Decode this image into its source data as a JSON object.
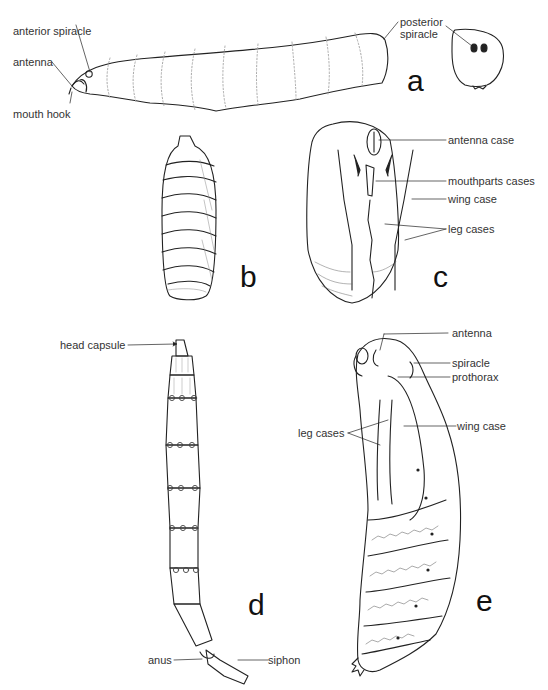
{
  "figure": {
    "panels": [
      {
        "id": "a",
        "letter": "a",
        "subject": "fly larva (maggot), lateral view, with posterior end view",
        "labels": [
          "anterior spiracle",
          "antenna",
          "mouth hook",
          "posterior spiracle"
        ]
      },
      {
        "id": "b",
        "letter": "b",
        "subject": "fly puparium",
        "labels": []
      },
      {
        "id": "c",
        "letter": "c",
        "subject": "pupa, ventral view",
        "labels": [
          "antenna case",
          "mouthparts cases",
          "wing case",
          "leg cases"
        ]
      },
      {
        "id": "d",
        "letter": "d",
        "subject": "aquatic larva with siphon",
        "labels": [
          "head capsule",
          "anus",
          "siphon"
        ]
      },
      {
        "id": "e",
        "letter": "e",
        "subject": "pupa, lateral view",
        "labels": [
          "antenna",
          "spiracle",
          "prothorax",
          "leg cases",
          "wing case"
        ]
      }
    ]
  },
  "labels": {
    "a": {
      "anterior_spiracle": "anterior spiracle",
      "antenna": "antenna",
      "mouth_hook": "mouth hook",
      "posterior_spiracle_1": "posterior",
      "posterior_spiracle_2": "spiracle"
    },
    "c": {
      "antenna_case": "antenna case",
      "mouthparts_cases": "mouthparts cases",
      "wing_case": "wing case",
      "leg_cases": "leg cases"
    },
    "d": {
      "head_capsule": "head capsule",
      "anus": "anus",
      "siphon": "siphon"
    },
    "e": {
      "antenna": "antenna",
      "spiracle": "spiracle",
      "prothorax": "prothorax",
      "leg_cases": "leg cases",
      "wing_case": "wing case"
    }
  },
  "letters": {
    "a": "a",
    "b": "b",
    "c": "c",
    "d": "d",
    "e": "e"
  },
  "colors": {
    "line": "#222222",
    "dotted": "#999999",
    "background": "#ffffff"
  }
}
